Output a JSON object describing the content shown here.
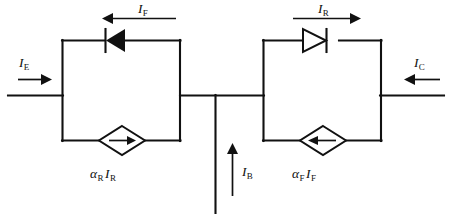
{
  "diagram": {
    "type": "circuit-schematic",
    "width": 452,
    "height": 214,
    "background_color": "#ffffff",
    "line_color": "#111111"
  },
  "labels": {
    "emitter_current": {
      "symbol": "I",
      "subscript": "E",
      "text": "I_E"
    },
    "collector_current": {
      "symbol": "I",
      "subscript": "C",
      "text": "I_C"
    },
    "base_current": {
      "symbol": "I",
      "subscript": "B",
      "text": "I_B"
    },
    "forward_diode_current": {
      "symbol": "I",
      "subscript": "F",
      "text": "I_F"
    },
    "reverse_diode_current": {
      "symbol": "I",
      "subscript": "R",
      "text": "I_R"
    },
    "left_source": {
      "alpha": "α",
      "alpha_sub": "R",
      "current": "I",
      "current_sub": "R",
      "text": "α_R I_R"
    },
    "right_source": {
      "alpha": "α",
      "alpha_sub": "F",
      "current": "I",
      "current_sub": "F",
      "text": "α_F I_F"
    }
  },
  "components": [
    {
      "name": "reverse-diode",
      "kind": "diode",
      "orientation": "left",
      "branch": "left-loop-top"
    },
    {
      "name": "left-current-source",
      "kind": "dependent-current-source",
      "arrow_direction": "right",
      "branch": "left-loop-bottom",
      "label": "α_R I_R"
    },
    {
      "name": "forward-diode",
      "kind": "diode",
      "orientation": "right",
      "branch": "right-loop-top"
    },
    {
      "name": "right-current-source",
      "kind": "dependent-current-source",
      "arrow_direction": "left",
      "branch": "right-loop-bottom",
      "label": "α_F I_F"
    }
  ],
  "terminals": [
    {
      "name": "emitter",
      "label": "I_E",
      "arrow_direction": "right",
      "side": "left"
    },
    {
      "name": "collector",
      "label": "I_C",
      "arrow_direction": "left",
      "side": "right"
    },
    {
      "name": "base",
      "label": "I_B",
      "arrow_direction": "up",
      "side": "bottom"
    }
  ],
  "current_arrows": [
    {
      "name": "I_F-arrow",
      "direction": "left",
      "above": "reverse-diode"
    },
    {
      "name": "I_R-arrow",
      "direction": "right",
      "above": "forward-diode"
    }
  ]
}
